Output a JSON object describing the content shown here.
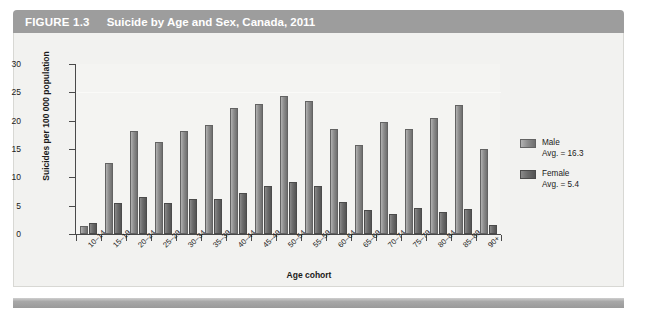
{
  "figure": {
    "number": "FIGURE 1.3",
    "title": "Suicide by Age and Sex, Canada, 2011"
  },
  "chart_data": {
    "type": "bar",
    "title": "Suicide by Age and Sex, Canada, 2011",
    "xlabel": "Age cohort",
    "ylabel": "Suicides per 100 000 population",
    "ylim": [
      0,
      30
    ],
    "yticks": [
      0,
      5,
      10,
      15,
      20,
      25,
      30
    ],
    "grid": false,
    "legend_position": "right",
    "categories": [
      "10–14",
      "15–19",
      "20–24",
      "25–29",
      "30–34",
      "35–39",
      "40–44",
      "45–49",
      "50–54",
      "55–59",
      "60–64",
      "65–69",
      "70–74",
      "75–79",
      "80–84",
      "85–89",
      "90+"
    ],
    "series": [
      {
        "name": "Male",
        "average": 16.3,
        "legend_label": "Male",
        "legend_sub": "Avg. = 16.3",
        "color": "#8e8e8e",
        "values": [
          1.4,
          12.5,
          18.1,
          16.2,
          18.1,
          19.3,
          22.2,
          23.0,
          24.3,
          23.5,
          18.6,
          15.7,
          19.8,
          18.6,
          20.4,
          22.7,
          15.0
        ]
      },
      {
        "name": "Female",
        "average": 5.4,
        "legend_label": "Female",
        "legend_sub": "Avg. = 5.4",
        "color": "#6c6c6c",
        "values": [
          1.9,
          5.5,
          6.6,
          5.4,
          6.1,
          6.1,
          7.3,
          8.4,
          9.1,
          8.5,
          5.7,
          4.2,
          3.5,
          4.6,
          3.9,
          4.5,
          1.6
        ]
      }
    ]
  }
}
